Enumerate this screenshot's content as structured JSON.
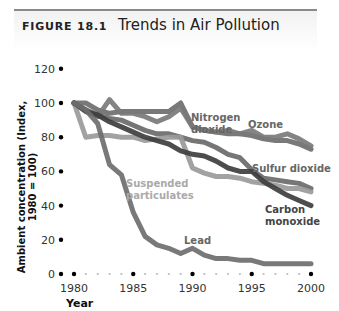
{
  "figure": {
    "label": "FIGURE 18.1",
    "title": "Trends in Air Pollution"
  },
  "axes": {
    "ylabel": "Ambient concentration (Index, 1980 = 100)",
    "xlabel": "Year",
    "yticks": [
      "0",
      "20",
      "40",
      "60",
      "80",
      "100",
      "120"
    ],
    "xticks": [
      "1980",
      "1985",
      "1990",
      "1995",
      "2000"
    ]
  },
  "labels": {
    "nitrogen_1": "Nitrogen",
    "nitrogen_2": "dioxide",
    "ozone": "Ozone",
    "sulfur": "Sulfur dioxide",
    "suspended_1": "Suspended",
    "suspended_2": "particulates",
    "carbon_1": "Carbon",
    "carbon_2": "monoxide",
    "lead": "Lead"
  },
  "chart_data": {
    "type": "line",
    "title": "Trends in Air Pollution",
    "xlabel": "Year",
    "ylabel": "Ambient concentration (Index, 1980 = 100)",
    "ylim": [
      0,
      120
    ],
    "xlim": [
      1980,
      2000
    ],
    "grid": false,
    "legend": "inline labels",
    "x": [
      1980,
      1981,
      1982,
      1983,
      1984,
      1985,
      1986,
      1987,
      1988,
      1989,
      1990,
      1991,
      1992,
      1993,
      1994,
      1995,
      1996,
      1997,
      1998,
      1999,
      2000
    ],
    "series": [
      {
        "name": "Nitrogen dioxide",
        "color": "#6e6e6e",
        "values": [
          100,
          100,
          96,
          94,
          95,
          95,
          95,
          95,
          95,
          100,
          86,
          84,
          83,
          82,
          82,
          81,
          79,
          78,
          78,
          76,
          73
        ]
      },
      {
        "name": "Ozone",
        "color": "#7a7a7a",
        "values": [
          100,
          96,
          92,
          102,
          94,
          94,
          92,
          89,
          92,
          97,
          86,
          84,
          83,
          84,
          82,
          84,
          80,
          80,
          82,
          79,
          75
        ]
      },
      {
        "name": "Sulfur dioxide",
        "color": "#6a6a6a",
        "values": [
          100,
          96,
          93,
          91,
          90,
          87,
          84,
          82,
          82,
          80,
          78,
          77,
          74,
          70,
          68,
          61,
          56,
          55,
          54,
          53,
          50
        ]
      },
      {
        "name": "Suspended particulates",
        "color": "#9a9a9a",
        "values": [
          100,
          80,
          81,
          81,
          80,
          80,
          78,
          79,
          80,
          80,
          62,
          59,
          57,
          57,
          56,
          54,
          53,
          52,
          50,
          50,
          48
        ]
      },
      {
        "name": "Carbon monoxide",
        "color": "#3e3e3e",
        "values": [
          100,
          95,
          93,
          89,
          86,
          83,
          80,
          78,
          76,
          72,
          70,
          69,
          66,
          62,
          60,
          60,
          54,
          50,
          46,
          43,
          40
        ]
      },
      {
        "name": "Lead",
        "color": "#6e6e6e",
        "values": [
          100,
          96,
          88,
          64,
          58,
          36,
          22,
          17,
          15,
          12,
          15,
          11,
          9,
          9,
          8,
          8,
          6,
          6,
          6,
          6,
          6
        ]
      }
    ]
  }
}
